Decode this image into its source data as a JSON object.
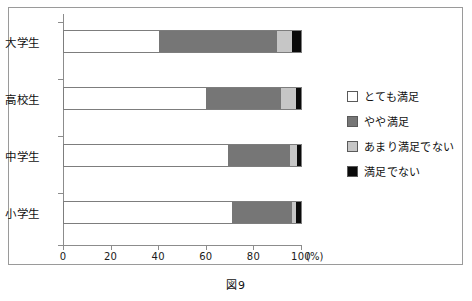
{
  "caption": "図9",
  "chart_data": {
    "type": "bar",
    "orientation": "horizontal",
    "stacked": true,
    "normalized_percent": true,
    "title": "",
    "subtitle": "",
    "xlabel": "(%)",
    "ylabel": "",
    "xlim": [
      0,
      100
    ],
    "xticks": [
      0,
      20,
      40,
      60,
      80,
      100
    ],
    "xtick_labels": [
      "0",
      "20",
      "40",
      "60",
      "80",
      "100"
    ],
    "grid": false,
    "legend_position": "right",
    "categories": [
      "大学生",
      "高校生",
      "中学生",
      "小学生"
    ],
    "series": [
      {
        "name": "とても満足",
        "color": "#ffffff",
        "values": [
          40,
          60,
          69,
          71
        ]
      },
      {
        "name": "やや満足",
        "color": "#767676",
        "values": [
          50,
          31.5,
          26.5,
          25
        ]
      },
      {
        "name": "あまり満足でない",
        "color": "#c6c6c6",
        "values": [
          6,
          6.5,
          3,
          2
        ]
      },
      {
        "name": "満足でない",
        "color": "#0a0a0a",
        "values": [
          4,
          2,
          1.5,
          2
        ]
      }
    ]
  }
}
